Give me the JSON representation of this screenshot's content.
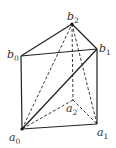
{
  "diagram": {
    "type": "triangular-prism",
    "vertices": {
      "b0": {
        "x": 21,
        "y": 56,
        "label": "b",
        "sub": "0",
        "lx": 7,
        "ly": 58
      },
      "b1": {
        "x": 97,
        "y": 49,
        "label": "b",
        "sub": "1",
        "lx": 99,
        "ly": 52
      },
      "b2": {
        "x": 72,
        "y": 24,
        "label": "b",
        "sub": "2",
        "lx": 67,
        "ly": 20
      },
      "a0": {
        "x": 22,
        "y": 129,
        "label": "a",
        "sub": "0",
        "lx": 9,
        "ly": 141
      },
      "a1": {
        "x": 97,
        "y": 124,
        "label": "a",
        "sub": "1",
        "lx": 97,
        "ly": 136
      },
      "a2": {
        "x": 73,
        "y": 100,
        "label": "a",
        "sub": "2",
        "lx": 66,
        "ly": 112
      }
    },
    "solid_edges": [
      [
        "b0",
        "b1"
      ],
      [
        "b1",
        "b2"
      ],
      [
        "b2",
        "b0"
      ],
      [
        "b0",
        "a0"
      ],
      [
        "b1",
        "a1"
      ],
      [
        "a0",
        "a1"
      ],
      [
        "a0",
        "b1"
      ]
    ],
    "dashed_edges": [
      [
        "b2",
        "a2"
      ],
      [
        "a2",
        "a0"
      ],
      [
        "a2",
        "a1"
      ],
      [
        "a0",
        "b2"
      ],
      [
        "b2",
        "a1"
      ]
    ],
    "line_color": "#222222"
  }
}
